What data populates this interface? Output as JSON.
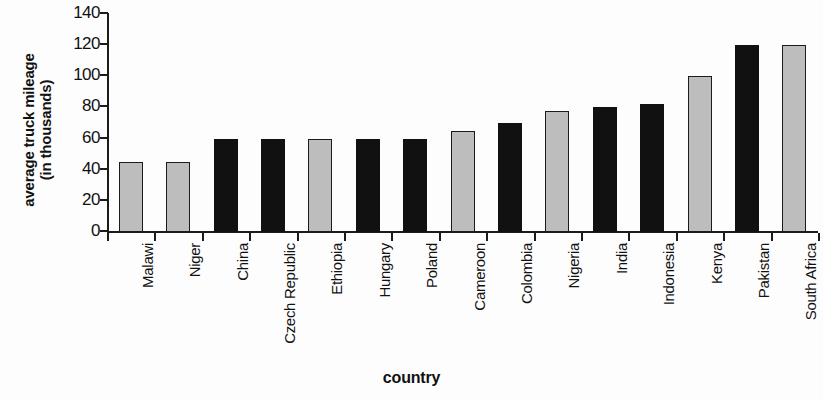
{
  "chart_data": {
    "type": "bar",
    "title": "",
    "xlabel": "country",
    "ylabel": "average truck mileage (in thousands)",
    "ylabel_lines": [
      "average truck mileage",
      "(in thousands)"
    ],
    "ylim": [
      0,
      140
    ],
    "yticks": [
      0,
      20,
      40,
      60,
      80,
      100,
      120,
      140
    ],
    "ytick_labels": [
      "0",
      "20",
      "40",
      "60",
      "80",
      "100",
      "120",
      "140"
    ],
    "grid": false,
    "legend": null,
    "categories": [
      "Malawi",
      "Niger",
      "China",
      "Czech Republic",
      "Ethiopia",
      "Hungary",
      "Poland",
      "Cameroon",
      "Colombia",
      "Nigeria",
      "India",
      "Indonesia",
      "Kenya",
      "Pakistan",
      "South Africa"
    ],
    "values": [
      45,
      45,
      60,
      60,
      60,
      60,
      60,
      65,
      70,
      78,
      80,
      82,
      100,
      120,
      120
    ],
    "bar_colors": [
      "gray",
      "gray",
      "black",
      "black",
      "gray",
      "black",
      "black",
      "gray",
      "black",
      "gray",
      "black",
      "black",
      "gray",
      "black",
      "gray"
    ],
    "colors": {
      "gray": "#bdbdbd",
      "black": "#111111",
      "axis": "#1b1b1b",
      "background": "#fdfdfd"
    }
  }
}
